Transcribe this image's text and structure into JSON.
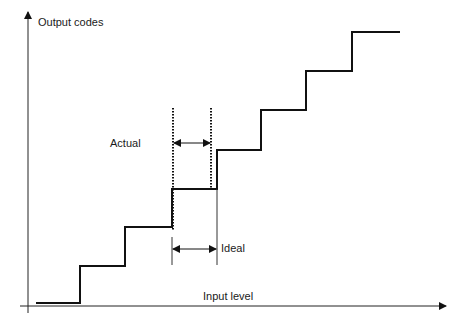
{
  "diagram": {
    "type": "adc-transfer-staircase",
    "y_axis_label": "Output codes",
    "x_axis_label": "Input level",
    "annotations": {
      "actual_label": "Actual",
      "ideal_label": "Ideal"
    },
    "staircase": {
      "step_count": 8,
      "points": [
        [
          36,
          303
        ],
        [
          80,
          303
        ],
        [
          80,
          266
        ],
        [
          125,
          266
        ],
        [
          125,
          227
        ],
        [
          172,
          227
        ],
        [
          172,
          189
        ],
        [
          217,
          189
        ],
        [
          217,
          150
        ],
        [
          261,
          150
        ],
        [
          261,
          110
        ],
        [
          306,
          110
        ],
        [
          306,
          71
        ],
        [
          352,
          71
        ],
        [
          352,
          32
        ],
        [
          400,
          32
        ]
      ]
    },
    "colors": {
      "line": "#111111",
      "text": "#1a1a1a",
      "background": "#ffffff"
    }
  }
}
